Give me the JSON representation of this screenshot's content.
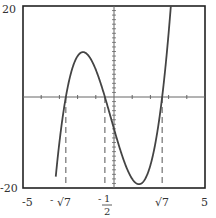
{
  "chart_data": {
    "type": "line",
    "title": "",
    "xlabel": "",
    "ylabel": "",
    "xlim": [
      -5,
      5
    ],
    "ylim": [
      -20,
      20
    ],
    "grid": false,
    "function": "f(x) = 2x^3 + x^2 - 14x - 7",
    "roots": [
      {
        "label_prefix": "-",
        "label": "√7",
        "value": -2.6458
      },
      {
        "label_prefix": "-",
        "label": "1/2",
        "value": -0.5
      },
      {
        "label_prefix": "",
        "label": "√7",
        "value": 2.6458
      }
    ],
    "x_tick_labels": [
      {
        "text": "-5",
        "value": -5
      },
      {
        "text": "5",
        "value": 5
      }
    ],
    "y_tick_labels": [
      {
        "text": "20",
        "value": 20
      },
      {
        "text": "-20",
        "value": -20
      }
    ],
    "series": [
      {
        "name": "f(x)",
        "x": [
          -3.0,
          -2.6458,
          -2.5,
          -2.0,
          -1.7,
          -1.5,
          -1.0,
          -0.5,
          0.0,
          0.5,
          1.0,
          1.37,
          1.5,
          2.0,
          2.5,
          2.6458,
          3.0,
          3.3
        ],
        "values": [
          -16.0,
          0.0,
          3.0,
          9.0,
          9.9,
          9.5,
          6.0,
          0.0,
          -7.0,
          -13.5,
          -18.0,
          -18.7,
          -18.5,
          -15.0,
          -4.5,
          0.0,
          14.0,
          32.0
        ]
      }
    ],
    "annotations": [
      "dashed vertical lines at each root down to x-axis frame"
    ]
  },
  "labels": {
    "y_top": "20",
    "y_bottom": "-20",
    "x_left": "-5",
    "x_right": "5",
    "root1_sign": "-",
    "root1": "√7",
    "root2_sign": "-",
    "root2_num": "1",
    "root2_den": "2",
    "root3": "√7"
  }
}
